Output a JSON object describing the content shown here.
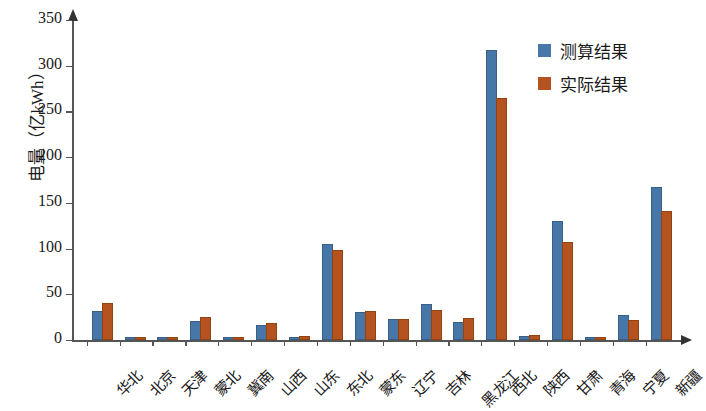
{
  "chart_data": {
    "type": "bar",
    "title": "",
    "xlabel": "",
    "ylabel": "电量（亿kWh）",
    "ylim": [
      0,
      350
    ],
    "y_ticks": [
      0,
      50,
      100,
      150,
      200,
      250,
      300,
      350
    ],
    "grid": false,
    "legend_position": "top-right",
    "categories": [
      "华北",
      "北京",
      "天津",
      "蒙北",
      "冀南",
      "山西",
      "山东",
      "东北",
      "蒙东",
      "辽宁",
      "吉林",
      "黑龙江",
      "西北",
      "陕西",
      "甘肃",
      "青海",
      "宁夏",
      "新疆"
    ],
    "series": [
      {
        "name": "测算结果",
        "color": "#4677a8",
        "values": [
          30,
          0.5,
          0.5,
          19,
          1,
          14,
          1,
          103,
          28,
          21,
          37,
          17,
          315,
          2,
          128,
          0.5,
          25,
          165
        ]
      },
      {
        "name": "实际结果",
        "color": "#b4531f",
        "values": [
          38,
          0.5,
          0.5,
          23,
          0.5,
          16,
          2,
          96,
          30,
          21,
          31,
          22,
          263,
          3,
          105,
          0.5,
          20,
          139
        ]
      }
    ]
  },
  "axis": {
    "y_title": "电量（亿kWh）",
    "tick_labels": [
      "350",
      "300",
      "250",
      "200",
      "150",
      "100",
      "50",
      "0"
    ]
  },
  "legend": {
    "items": [
      {
        "label": "测算结果",
        "color": "#4677a8"
      },
      {
        "label": "实际结果",
        "color": "#b4531f"
      }
    ]
  }
}
